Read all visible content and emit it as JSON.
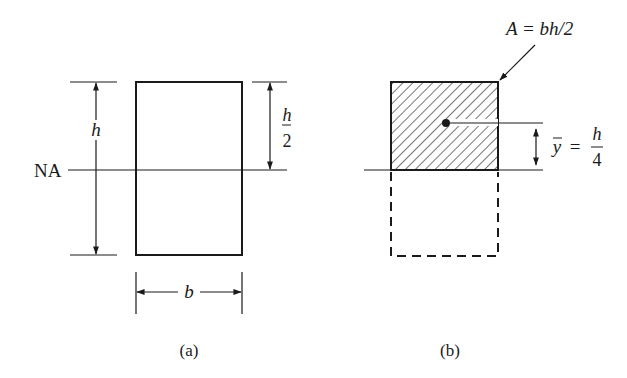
{
  "figure_a": {
    "caption": "(a)",
    "height_label": "h",
    "half_height_num": "h",
    "half_height_den": "2",
    "width_label": "b",
    "neutral_axis_label": "NA"
  },
  "figure_b": {
    "caption": "(b)",
    "area_label": "A = bh/2",
    "ybar_symbol": "y",
    "ybar_equals": "=",
    "ybar_num": "h",
    "ybar_den": "4"
  },
  "colors": {
    "ink": "#1a1a1a",
    "background": "#ffffff"
  }
}
